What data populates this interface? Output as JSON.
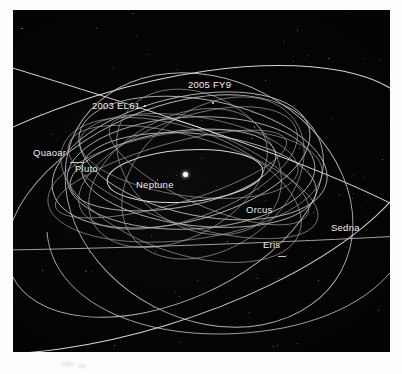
{
  "figure": {
    "panel_background": "#050506",
    "orbit_stroke": "#c8c8c6",
    "label_color": "#f2f2f0",
    "sun_marker_color": "#ffffff"
  },
  "labels": [
    {
      "name": "2005 FY9",
      "text": "2005 FY9",
      "x": 188,
      "y": 79
    },
    {
      "name": "2003 EL61",
      "text": "2003 EL61",
      "x": 92,
      "y": 100
    },
    {
      "name": "Quaoar",
      "text": "Quaoar",
      "x": 33,
      "y": 147
    },
    {
      "name": "Pluto",
      "text": "Pluto",
      "x": 75,
      "y": 163
    },
    {
      "name": "Neptune",
      "text": "Neptune",
      "x": 136,
      "y": 179
    },
    {
      "name": "Orcus",
      "text": "Orcus",
      "x": 246,
      "y": 204
    },
    {
      "name": "Eris",
      "text": "Eris",
      "x": 263,
      "y": 239
    },
    {
      "name": "Sedna",
      "text": "Sedna",
      "x": 331,
      "y": 222
    }
  ],
  "sun": {
    "label": "sun-marker",
    "x": 185,
    "y": 174
  },
  "chart_data": {
    "type": "scatter",
    "xlabel": "",
    "ylabel": "",
    "grid": false,
    "legend": "none",
    "projection": "oblique perspective view of the outer solar system",
    "center_body": "Sun",
    "objects": [
      {
        "name": "Neptune",
        "orbit": "innermost near-circular ellipse",
        "label_shown": true
      },
      {
        "name": "Pluto",
        "orbit": "inclined eccentric ellipse crossing Neptune",
        "label_shown": true
      },
      {
        "name": "Quaoar",
        "orbit": "large near-circular ellipse, left side",
        "label_shown": true
      },
      {
        "name": "Orcus",
        "orbit": "inclined ellipse, right of centre",
        "label_shown": true
      },
      {
        "name": "2003 EL61",
        "orbit": "inclined ellipse, upper left",
        "label_shown": true
      },
      {
        "name": "2005 FY9",
        "orbit": "inclined ellipse, upper centre",
        "label_shown": true
      },
      {
        "name": "Eris",
        "orbit": "steeply inclined highly eccentric ellipse",
        "label_shown": true
      },
      {
        "name": "Sedna",
        "orbit": "very large highly eccentric ellipse extending beyond the frame",
        "label_shown": true
      }
    ]
  }
}
